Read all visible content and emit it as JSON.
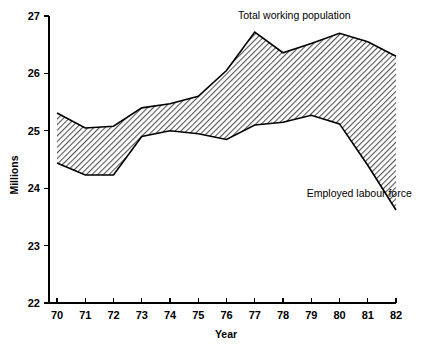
{
  "chart_data": {
    "type": "area",
    "title": "",
    "subtitle": "",
    "xlabel": "Year",
    "ylabel": "Millions",
    "xlim": [
      69.5,
      82.3
    ],
    "ylim": [
      22,
      27
    ],
    "grid": false,
    "legend_position": "inline-annotation",
    "x": [
      70,
      71,
      72,
      73,
      74,
      75,
      76,
      77,
      78,
      79,
      80,
      81,
      82
    ],
    "xtick_labels": [
      "70",
      "71",
      "72",
      "73",
      "74",
      "75",
      "76",
      "77",
      "78",
      "79",
      "80",
      "81",
      "82"
    ],
    "ytick_labels": [
      "22",
      "23",
      "24",
      "25",
      "26",
      "27"
    ],
    "ytick_values": [
      22,
      23,
      24,
      25,
      26,
      27
    ],
    "series": [
      {
        "name": "Total working population",
        "values": [
          25.31,
          25.05,
          25.08,
          25.4,
          25.47,
          25.6,
          26.05,
          26.72,
          26.36,
          26.52,
          26.7,
          26.55,
          26.3
        ]
      },
      {
        "name": "Employed labour force",
        "values": [
          24.44,
          24.23,
          24.23,
          24.9,
          25.0,
          24.95,
          24.85,
          25.1,
          25.15,
          25.27,
          25.12,
          24.4,
          23.62
        ]
      }
    ],
    "annotations": [
      {
        "text": "Total working population",
        "x": 78.4,
        "y": 26.95
      },
      {
        "text": "Employed labour force",
        "x": 80.7,
        "y": 23.85
      }
    ]
  }
}
